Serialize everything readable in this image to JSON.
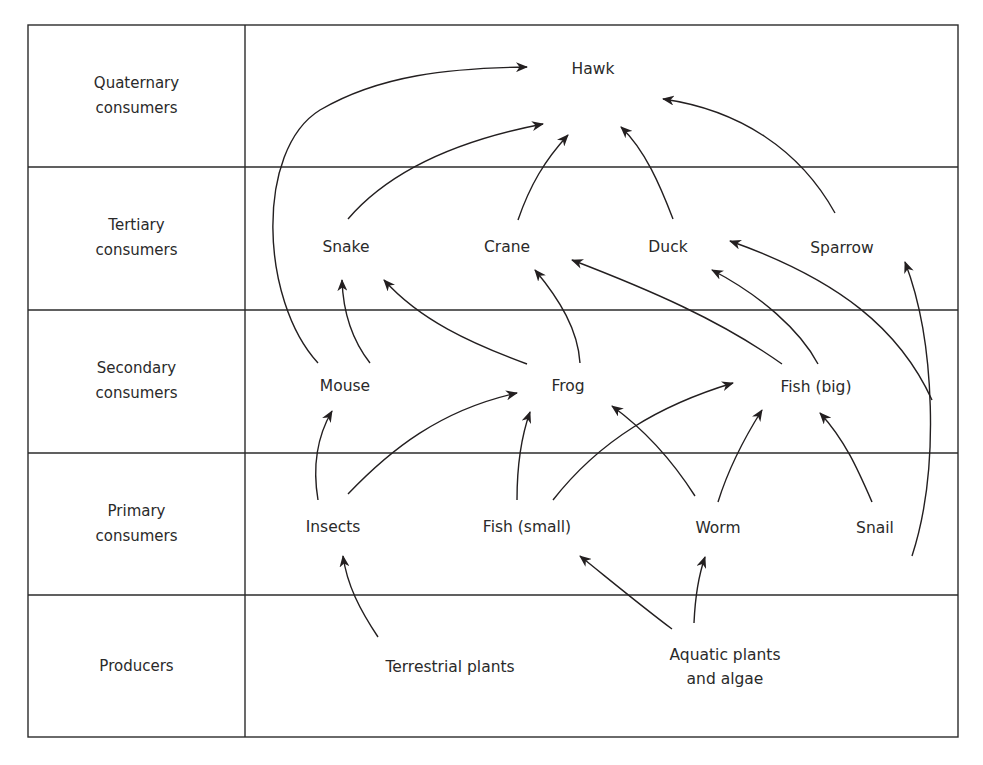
{
  "diagram": {
    "type": "food-web",
    "levels": [
      {
        "id": "quaternary",
        "label_line1": "Quaternary",
        "label_line2": "consumers",
        "y_center": 96
      },
      {
        "id": "tertiary",
        "label_line1": "Tertiary",
        "label_line2": "consumers",
        "y_center": 238
      },
      {
        "id": "secondary",
        "label_line1": "Secondary",
        "label_line2": "consumers",
        "y_center": 381
      },
      {
        "id": "primary",
        "label_line1": "Primary",
        "label_line2": "consumers",
        "y_center": 524
      },
      {
        "id": "producers",
        "label_line1": "Producers",
        "label_line2": "",
        "y_center": 666
      }
    ],
    "nodes": {
      "hawk": {
        "label": "Hawk",
        "level": "quaternary"
      },
      "snake": {
        "label": "Snake",
        "level": "tertiary"
      },
      "crane": {
        "label": "Crane",
        "level": "tertiary"
      },
      "duck": {
        "label": "Duck",
        "level": "tertiary"
      },
      "sparrow": {
        "label": "Sparrow",
        "level": "tertiary"
      },
      "mouse": {
        "label": "Mouse",
        "level": "secondary"
      },
      "frog": {
        "label": "Frog",
        "level": "secondary"
      },
      "fish_big": {
        "label": "Fish (big)",
        "level": "secondary"
      },
      "insects": {
        "label": "Insects",
        "level": "primary"
      },
      "fish_small": {
        "label": "Fish (small)",
        "level": "primary"
      },
      "worm": {
        "label": "Worm",
        "level": "primary"
      },
      "snail": {
        "label": "Snail",
        "level": "primary"
      },
      "terrestrial_plants": {
        "label": "Terrestrial plants",
        "level": "producers"
      },
      "aquatic_plants_line1": {
        "label": "Aquatic plants",
        "level": "producers"
      },
      "aquatic_plants_line2": {
        "label": "and algae",
        "level": "producers"
      }
    },
    "edges": [
      {
        "from": "Mouse",
        "to": "Hawk"
      },
      {
        "from": "Snake",
        "to": "Hawk"
      },
      {
        "from": "Crane",
        "to": "Hawk"
      },
      {
        "from": "Duck",
        "to": "Hawk"
      },
      {
        "from": "Sparrow",
        "to": "Hawk"
      },
      {
        "from": "Mouse",
        "to": "Snake"
      },
      {
        "from": "Frog",
        "to": "Snake"
      },
      {
        "from": "Frog",
        "to": "Crane"
      },
      {
        "from": "Fish (big)",
        "to": "Crane"
      },
      {
        "from": "Fish (big)",
        "to": "Duck"
      },
      {
        "from": "Snail",
        "to": "Duck"
      },
      {
        "from": "Snail",
        "to": "Sparrow"
      },
      {
        "from": "Insects",
        "to": "Mouse"
      },
      {
        "from": "Insects",
        "to": "Frog"
      },
      {
        "from": "Fish (small)",
        "to": "Frog"
      },
      {
        "from": "Worm",
        "to": "Frog"
      },
      {
        "from": "Fish (small)",
        "to": "Fish (big)"
      },
      {
        "from": "Worm",
        "to": "Fish (big)"
      },
      {
        "from": "Snail",
        "to": "Fish (big)"
      },
      {
        "from": "Terrestrial plants",
        "to": "Insects"
      },
      {
        "from": "Aquatic plants and algae",
        "to": "Fish (small)"
      },
      {
        "from": "Aquatic plants and algae",
        "to": "Worm"
      }
    ],
    "colors": {
      "line": "#231f20",
      "text": "#2a2a2a",
      "background": "#ffffff"
    }
  }
}
